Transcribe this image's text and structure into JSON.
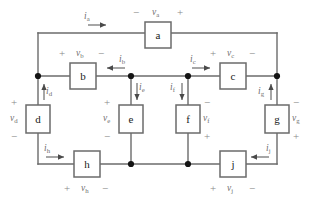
{
  "figure": {
    "type": "circuit-schematic"
  },
  "components": [
    {
      "id": "a",
      "label": "a",
      "name": "component-a",
      "x": 145,
      "y": 22,
      "w": 26,
      "h": 26
    },
    {
      "id": "b",
      "label": "b",
      "name": "component-b",
      "x": 70,
      "y": 63,
      "w": 26,
      "h": 26
    },
    {
      "id": "c",
      "label": "c",
      "name": "component-c",
      "x": 220,
      "y": 63,
      "w": 26,
      "h": 26
    },
    {
      "id": "d",
      "label": "d",
      "name": "component-d",
      "x": 27,
      "y": 105,
      "w": 24,
      "h": 28
    },
    {
      "id": "e",
      "label": "e",
      "name": "component-e",
      "x": 119,
      "y": 105,
      "w": 24,
      "h": 28
    },
    {
      "id": "f",
      "label": "f",
      "name": "component-f",
      "x": 176,
      "y": 105,
      "w": 24,
      "h": 28
    },
    {
      "id": "g",
      "label": "g",
      "name": "component-g",
      "x": 265,
      "y": 105,
      "w": 24,
      "h": 28
    },
    {
      "id": "h",
      "label": "h",
      "name": "component-h",
      "x": 74,
      "y": 151,
      "w": 26,
      "h": 26
    },
    {
      "id": "j",
      "label": "j",
      "name": "component-j",
      "x": 220,
      "y": 151,
      "w": 26,
      "h": 26
    }
  ],
  "currents": [
    {
      "id": "ia",
      "symbol": "i",
      "subscript": "a",
      "direction": "right",
      "name": "current-label-ia"
    },
    {
      "id": "ib",
      "symbol": "i",
      "subscript": "b",
      "direction": "left",
      "name": "current-label-ib"
    },
    {
      "id": "ic",
      "symbol": "i",
      "subscript": "c",
      "direction": "right",
      "name": "current-label-ic"
    },
    {
      "id": "id",
      "symbol": "i",
      "subscript": "d",
      "direction": "up",
      "name": "current-label-id"
    },
    {
      "id": "ie",
      "symbol": "i",
      "subscript": "e",
      "direction": "down",
      "name": "current-label-ie"
    },
    {
      "id": "if",
      "symbol": "i",
      "subscript": "f",
      "direction": "down",
      "name": "current-label-if"
    },
    {
      "id": "ig",
      "symbol": "i",
      "subscript": "g",
      "direction": "up",
      "name": "current-label-ig"
    },
    {
      "id": "ih",
      "symbol": "i",
      "subscript": "h",
      "direction": "right",
      "name": "current-label-ih"
    },
    {
      "id": "ij",
      "symbol": "i",
      "subscript": "j",
      "direction": "left",
      "name": "current-label-ij"
    }
  ],
  "voltages": [
    {
      "id": "va",
      "symbol": "v",
      "subscript": "a",
      "plus": "+",
      "minus": "−",
      "orientation": "horizontal",
      "polarity": "minus-left-plus-right",
      "name": "voltage-label-va"
    },
    {
      "id": "vb",
      "symbol": "v",
      "subscript": "b",
      "plus": "+",
      "minus": "−",
      "orientation": "horizontal",
      "polarity": "plus-left-minus-right",
      "name": "voltage-label-vb"
    },
    {
      "id": "vc",
      "symbol": "v",
      "subscript": "c",
      "plus": "+",
      "minus": "−",
      "orientation": "horizontal",
      "polarity": "plus-left-minus-right",
      "name": "voltage-label-vc"
    },
    {
      "id": "vd",
      "symbol": "v",
      "subscript": "d",
      "plus": "+",
      "minus": "−",
      "orientation": "vertical",
      "polarity": "plus-top-minus-bottom",
      "name": "voltage-label-vd"
    },
    {
      "id": "ve",
      "symbol": "v",
      "subscript": "e",
      "plus": "+",
      "minus": "−",
      "orientation": "vertical",
      "polarity": "plus-top-minus-bottom",
      "name": "voltage-label-ve"
    },
    {
      "id": "vf",
      "symbol": "v",
      "subscript": "f",
      "plus": "+",
      "minus": "−",
      "orientation": "vertical",
      "polarity": "minus-top-plus-bottom",
      "name": "voltage-label-vf"
    },
    {
      "id": "vg",
      "symbol": "v",
      "subscript": "g",
      "plus": "+",
      "minus": "−",
      "orientation": "vertical",
      "polarity": "minus-top-plus-bottom",
      "name": "voltage-label-vg"
    },
    {
      "id": "vh",
      "symbol": "v",
      "subscript": "h",
      "plus": "+",
      "minus": "−",
      "orientation": "horizontal",
      "polarity": "plus-left-minus-right",
      "name": "voltage-label-vh"
    },
    {
      "id": "vj",
      "symbol": "v",
      "subscript": "j",
      "plus": "+",
      "minus": "−",
      "orientation": "horizontal",
      "polarity": "plus-left-minus-right",
      "name": "voltage-label-vj"
    }
  ],
  "labels": {
    "ia": "i",
    "ia_sub": "a",
    "ib": "i",
    "ib_sub": "b",
    "ic": "i",
    "ic_sub": "c",
    "id": "i",
    "id_sub": "d",
    "ie": "i",
    "ie_sub": "e",
    "if": "i",
    "if_sub": "f",
    "ig": "i",
    "ig_sub": "g",
    "ih": "i",
    "ih_sub": "h",
    "ij": "i",
    "ij_sub": "j",
    "va": "v",
    "va_sub": "a",
    "vb": "v",
    "vb_sub": "b",
    "vc": "v",
    "vc_sub": "c",
    "vd": "v",
    "vd_sub": "d",
    "ve": "v",
    "ve_sub": "e",
    "vf": "v",
    "vf_sub": "f",
    "vg": "v",
    "vg_sub": "g",
    "vh": "v",
    "vh_sub": "h",
    "vj": "v",
    "vj_sub": "j",
    "plus": "+",
    "minus": "−"
  },
  "nodes": [
    {
      "name": "node-left-mid",
      "x": 38,
      "y": 76
    },
    {
      "name": "node-e-top",
      "x": 131,
      "y": 76
    },
    {
      "name": "node-f-top",
      "x": 188,
      "y": 76
    },
    {
      "name": "node-right-mid",
      "x": 277,
      "y": 76
    },
    {
      "name": "node-e-bottom",
      "x": 131,
      "y": 164
    },
    {
      "name": "node-f-bottom",
      "x": 188,
      "y": 164
    }
  ],
  "colors": {
    "wire": "#6b6b6b",
    "node": "#141414",
    "text": "#6f6f6f",
    "component_text": "#1a1a1a",
    "background": "#ffffff"
  }
}
